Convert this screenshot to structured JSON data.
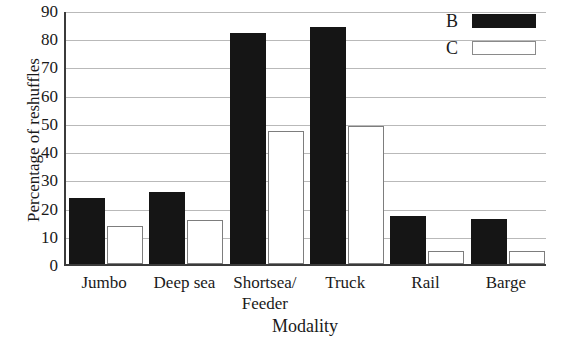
{
  "chart_data": {
    "type": "bar",
    "title": "",
    "xlabel": "Modality",
    "ylabel": "Percentage of reshuffles",
    "categories": [
      "Jumbo",
      "Deep sea",
      "Shortsea/ Feeder",
      "Truck",
      "Rail",
      "Barge"
    ],
    "category_lines": [
      [
        "Jumbo",
        ""
      ],
      [
        "Deep sea",
        ""
      ],
      [
        "Shortsea/",
        "Feeder"
      ],
      [
        "Truck",
        ""
      ],
      [
        "Rail",
        ""
      ],
      [
        "Barge",
        ""
      ]
    ],
    "series": [
      {
        "name": "B",
        "color": "#151515",
        "values": [
          23.5,
          25.5,
          82,
          84,
          17,
          16
        ]
      },
      {
        "name": "C",
        "color": "#ffffff",
        "values": [
          13.5,
          15.5,
          47,
          49,
          4.5,
          4.5
        ]
      }
    ],
    "ylim": [
      0,
      90
    ],
    "yticks": [
      90,
      80,
      70,
      60,
      50,
      40,
      30,
      20,
      10,
      0
    ],
    "ytick_labels": [
      "90",
      "80",
      "70",
      "60",
      "50",
      "40",
      "30",
      "20",
      "10",
      "0"
    ],
    "ytick_step": 10,
    "grid": true,
    "grid_axis": "y",
    "legend": {
      "position": "top-right",
      "entries": [
        {
          "label": "B",
          "swatch": "filled-black"
        },
        {
          "label": "C",
          "swatch": "outline-white"
        }
      ]
    },
    "axis_color": "#3b3b3b",
    "gridline_color": "#b9b9b9"
  }
}
